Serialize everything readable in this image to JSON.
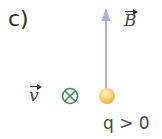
{
  "part_label": "c)",
  "field": {
    "symbol": "B",
    "has_vector_arrow": true,
    "direction": "up",
    "color": "#a9b4de"
  },
  "velocity": {
    "symbol": "v",
    "has_vector_arrow": true,
    "direction_icon": "into-page-x-in-circle",
    "color": "#3f8f4a"
  },
  "charge": {
    "symbol": "q",
    "condition": "> 0",
    "label": "q > 0",
    "color": "#f6c760"
  }
}
